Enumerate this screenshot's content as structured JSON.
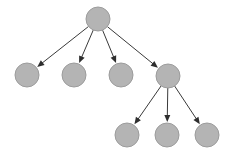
{
  "diagram": {
    "type": "tree",
    "width": 229,
    "height": 153,
    "style": {
      "node_fill": "#b4b4b4",
      "node_stroke": "#9c9c9c",
      "edge_color": "#3a3a3a",
      "arrow_color": "#2e2e2e",
      "background": "#ffffff",
      "node_radius": 12
    },
    "nodes": [
      {
        "id": "root",
        "label": "",
        "x": 98,
        "y": 19
      },
      {
        "id": "child-1",
        "label": "",
        "x": 27,
        "y": 75
      },
      {
        "id": "child-2",
        "label": "",
        "x": 74,
        "y": 75
      },
      {
        "id": "child-3",
        "label": "",
        "x": 121,
        "y": 75
      },
      {
        "id": "child-4",
        "label": "",
        "x": 168,
        "y": 76
      },
      {
        "id": "grandchild-1",
        "label": "",
        "x": 127,
        "y": 135
      },
      {
        "id": "grandchild-2",
        "label": "",
        "x": 167,
        "y": 135
      },
      {
        "id": "grandchild-3",
        "label": "",
        "x": 207,
        "y": 135
      }
    ],
    "edges": [
      {
        "from": "root",
        "to": "child-1"
      },
      {
        "from": "root",
        "to": "child-2"
      },
      {
        "from": "root",
        "to": "child-3"
      },
      {
        "from": "root",
        "to": "child-4"
      },
      {
        "from": "child-4",
        "to": "grandchild-1"
      },
      {
        "from": "child-4",
        "to": "grandchild-2"
      },
      {
        "from": "child-4",
        "to": "grandchild-3"
      }
    ]
  }
}
